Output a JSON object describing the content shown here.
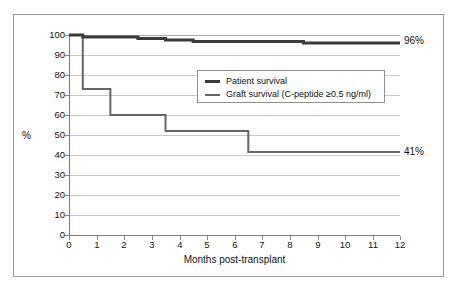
{
  "chart_data": {
    "type": "line",
    "subtype": "kaplan-meier-step",
    "title": "",
    "xlabel": "Months post-transplant",
    "ylabel": "%",
    "xlim": [
      0,
      12
    ],
    "ylim": [
      0,
      100
    ],
    "xticks": [
      0,
      1,
      2,
      3,
      4,
      5,
      6,
      7,
      8,
      9,
      10,
      11,
      12
    ],
    "yticks": [
      0,
      10,
      20,
      30,
      40,
      50,
      60,
      70,
      80,
      90,
      100
    ],
    "grid": "horizontal",
    "legend_position": "inside-upper-center",
    "series": [
      {
        "name": "Patient survival",
        "color": "#3a3a3a",
        "line_width": 3,
        "steps_x": [
          0,
          0.5,
          2.5,
          3.5,
          4.5,
          8.5,
          12
        ],
        "steps_y": [
          100,
          99,
          98.2,
          97.5,
          96.8,
          96,
          96
        ]
      },
      {
        "name": "Graft survival (C-peptide ≥0.5 ng/ml)",
        "color": "#666666",
        "line_width": 2,
        "steps_x": [
          0,
          0.5,
          1.5,
          3.5,
          6.5,
          12
        ],
        "steps_y": [
          100,
          73,
          60,
          52,
          41.5,
          41.5
        ]
      }
    ],
    "annotations": [
      {
        "text": "96%",
        "x": 12,
        "y": 96,
        "series": "Patient survival"
      },
      {
        "text": "41%",
        "x": 12,
        "y": 41.5,
        "series": "Graft survival (C-peptide ≥0.5 ng/ml)"
      }
    ]
  },
  "axes": {
    "y_title": "%",
    "x_title": "Months post-transplant",
    "y_tick_labels": [
      "100",
      "90",
      "80",
      "70",
      "60",
      "50",
      "40",
      "30",
      "20",
      "10",
      "0"
    ],
    "x_tick_labels": [
      "0",
      "1",
      "2",
      "3",
      "4",
      "5",
      "6",
      "7",
      "8",
      "9",
      "10",
      "11",
      "12"
    ]
  },
  "legend": {
    "entries": [
      {
        "label": "Patient survival"
      },
      {
        "label": "Graft survival (C-peptide ≥0.5 ng/ml)"
      }
    ]
  },
  "end_labels": {
    "patient": "96%",
    "graft": "41%"
  },
  "colors": {
    "patient_line": "#3a3a3a",
    "graft_line": "#666666",
    "gridline": "#c9c9c9",
    "axis": "#7a7a7a",
    "frame": "#9a9a9a",
    "background": "#ffffff"
  }
}
